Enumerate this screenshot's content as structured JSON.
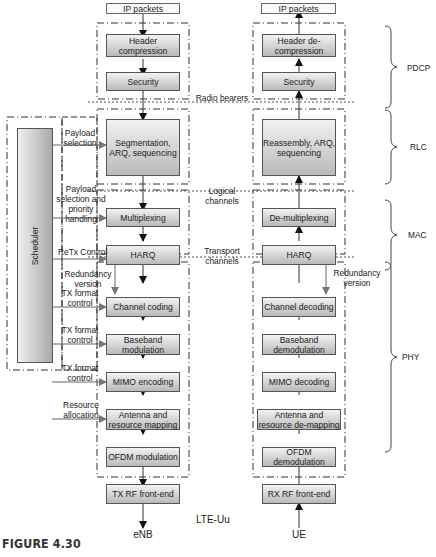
{
  "enb": {
    "top": "IP packets",
    "blocks": [
      "Header compression",
      "Security",
      "Segmentation, ARQ, sequencing",
      "Multiplexing",
      "HARQ",
      "Channel coding",
      "Baseband modulation",
      "MIMO encoding",
      "Antenna and resource mapping",
      "OFDM modulation"
    ],
    "rf": "TX RF front-end",
    "label": "eNB"
  },
  "ue": {
    "top": "IP packets",
    "blocks": [
      "Header de-compression",
      "Security",
      "Reassembly, ARQ, sequencing",
      "De-multiplexing",
      "HARQ",
      "Channel decoding",
      "Baseband demodulation",
      "MIMO decoding",
      "Antenna and resource de-mapping",
      "OFDM demodulation"
    ],
    "rf": "RX RF front-end",
    "label": "UE"
  },
  "scheduler": {
    "label": "Scheduler",
    "controls": [
      "Payload selection",
      "Payload selection and priority handling",
      "ReTx Control",
      "Redundancy version",
      "TX format control",
      "TX format control",
      "TX format control",
      "Resource allocation"
    ]
  },
  "channels": {
    "radio": "Radio bearers",
    "logical": "Logical channels",
    "transport": "Transport channels"
  },
  "ue_redundancy": "Redundancy version",
  "layers": [
    "PDCP",
    "RLC",
    "MAC",
    "PHY"
  ],
  "interface": "LTE-Uu",
  "caption": "FIGURE 4.30"
}
